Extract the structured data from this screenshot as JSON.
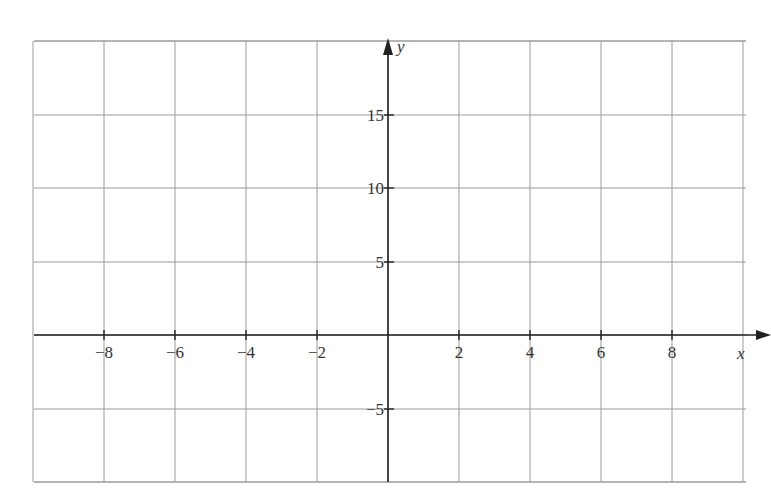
{
  "chart_data": {
    "type": "line",
    "title": "",
    "xlabel": "x",
    "ylabel": "y",
    "xlim": [
      -10,
      10
    ],
    "ylim": [
      -10,
      20
    ],
    "grid": true,
    "x_ticks": [
      -8,
      -6,
      -4,
      -2,
      2,
      4,
      6,
      8
    ],
    "x_tick_labels": [
      "−8",
      "−6",
      "−4",
      "−2",
      "2",
      "4",
      "6",
      "8"
    ],
    "y_ticks": [
      15,
      10,
      5,
      -5
    ],
    "y_tick_labels": [
      "15",
      "10",
      "5",
      "−5"
    ],
    "x_grid_step": 2,
    "y_grid_step": 5,
    "series": [],
    "legend": null
  },
  "labels": {
    "x_axis": "x",
    "y_axis": "y"
  }
}
